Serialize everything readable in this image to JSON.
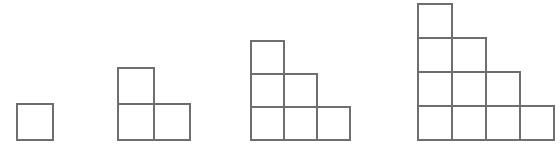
{
  "canvas": {
    "width": 560,
    "height": 156,
    "background": "#ffffff",
    "stroke_color": "#6e6e6e",
    "stroke_width": 1.1,
    "baseline_y": 140
  },
  "chart_data": {
    "type": "diagram",
    "title": "",
    "subtitle": "",
    "xlabel": "",
    "ylabel": "",
    "categories": [
      "Figure 1",
      "Figure 2",
      "Figure 3",
      "Figure 4"
    ],
    "values": [
      1,
      3,
      6,
      10
    ],
    "series": [
      {
        "name": "Total squares",
        "values": [
          1,
          3,
          6,
          10
        ]
      },
      {
        "name": "Base width (squares)",
        "values": [
          1,
          2,
          3,
          4
        ]
      },
      {
        "name": "Max height (squares)",
        "values": [
          1,
          2,
          3,
          4
        ]
      }
    ],
    "grid": false,
    "legend": "none"
  },
  "figures": [
    {
      "name": "figure-1",
      "label": "",
      "step_count": 1,
      "square_count": 1,
      "column_heights": [
        1
      ],
      "cell_size": 36,
      "left": 17,
      "bottom": 16,
      "top_y": 103
    },
    {
      "name": "figure-2",
      "label": "",
      "step_count": 2,
      "square_count": 3,
      "column_heights": [
        2,
        1
      ],
      "cell_size": 36,
      "left": 118,
      "bottom": 16,
      "top_y": 68
    },
    {
      "name": "figure-3",
      "label": "",
      "step_count": 3,
      "square_count": 6,
      "column_heights": [
        3,
        2,
        1
      ],
      "cell_size": 33,
      "left": 251,
      "bottom": 16,
      "top_y": 41
    },
    {
      "name": "figure-4",
      "label": "",
      "step_count": 4,
      "square_count": 10,
      "column_heights": [
        4,
        3,
        2,
        1
      ],
      "cell_size": 34,
      "left": 418,
      "bottom": 16,
      "top_y": 4
    }
  ]
}
